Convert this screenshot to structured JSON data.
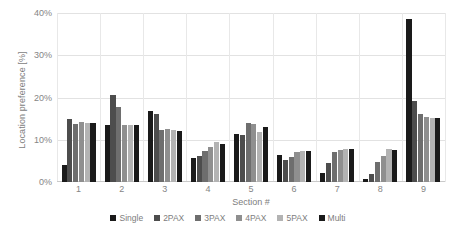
{
  "chart_data": {
    "type": "bar",
    "title": "",
    "xlabel": "Section #",
    "ylabel": "Location preference [%]",
    "categories": [
      "1",
      "2",
      "3",
      "4",
      "5",
      "6",
      "7",
      "8",
      "9"
    ],
    "ylim": [
      0,
      40
    ],
    "ytick_labels": [
      "0%",
      "10%",
      "20%",
      "30%",
      "40%"
    ],
    "ytick_values": [
      0,
      10,
      20,
      30,
      40
    ],
    "grid": true,
    "legend_position": "bottom",
    "series": [
      {
        "name": "Single",
        "color": "#1a1a1a",
        "values": [
          4.1,
          13.5,
          16.7,
          5.6,
          11.3,
          6.4,
          2.2,
          0.8,
          38.7
        ]
      },
      {
        "name": "2PAX",
        "color": "#4d4d4d",
        "values": [
          14.8,
          20.5,
          16.1,
          6.1,
          11.2,
          5.2,
          4.5,
          1.9,
          19.2
        ]
      },
      {
        "name": "3PAX",
        "color": "#6e6e6e",
        "values": [
          13.8,
          17.8,
          12.4,
          7.3,
          14.0,
          5.9,
          7.0,
          4.7,
          16.1
        ]
      },
      {
        "name": "4PAX",
        "color": "#8f8f8f",
        "values": [
          14.1,
          13.5,
          12.6,
          8.3,
          13.7,
          7.1,
          7.5,
          6.2,
          15.5
        ]
      },
      {
        "name": "5PAX",
        "color": "#b3b3b3",
        "values": [
          13.9,
          13.5,
          12.2,
          9.5,
          11.9,
          7.4,
          7.7,
          7.7,
          15.1
        ]
      },
      {
        "name": "Multi",
        "color": "#1a1a1a",
        "values": [
          13.9,
          13.5,
          12.0,
          9.0,
          13.0,
          7.4,
          7.7,
          7.5,
          15.2
        ]
      }
    ]
  }
}
